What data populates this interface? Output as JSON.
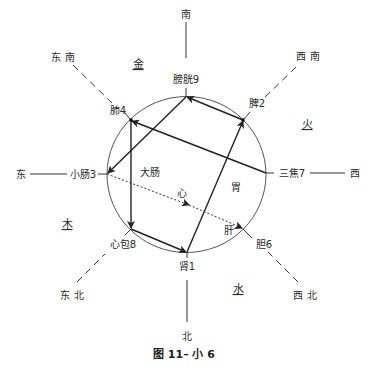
{
  "caption": "图 11– 小 6",
  "directions": {
    "south": "南",
    "north": "北",
    "east": "东",
    "west": "西",
    "southeast": "东 南",
    "southwest": "西 南",
    "northeast": "东 北",
    "northwest": "西 北"
  },
  "elements": {
    "metal": "金",
    "fire": "火",
    "wood": "木",
    "water": "水"
  },
  "nodes": {
    "bladder": "膀胱9",
    "spleen": "脾2",
    "sanjiao": "三焦7",
    "gallbladder": "胆6",
    "kidney": "肾1",
    "pericardium": "心包8",
    "small_intestine": "小肠3",
    "lung": "肺4"
  },
  "inner_labels": {
    "large_intestine": "大肠",
    "heart": "心",
    "stomach": "胃",
    "liver": "肝"
  },
  "colors": {
    "line": "#222222",
    "dash": "#333333",
    "text": "#2a2a2a"
  }
}
